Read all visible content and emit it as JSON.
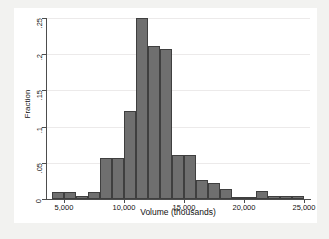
{
  "chart_data": {
    "type": "bar",
    "title": "",
    "xlabel": "Volume (thousands)",
    "ylabel": "Fraction",
    "xlim": [
      3500,
      25500
    ],
    "ylim": [
      0,
      0.25
    ],
    "grid": true,
    "legend": null,
    "bin_width": 1000,
    "bar_color": "#6f6f6f",
    "bar_edge_color": "#3f3f3f",
    "xticks": [
      5000,
      10000,
      15000,
      20000,
      25000
    ],
    "xtick_labels": [
      "5,000",
      "10,000",
      "15,000",
      "20,000",
      "25,000"
    ],
    "yticks": [
      0,
      0.05,
      0.1,
      0.15,
      0.2,
      0.25
    ],
    "ytick_labels": [
      "0",
      ".05",
      ".1",
      ".15",
      ".2",
      ".25"
    ],
    "bins": [
      {
        "x0": 4000,
        "x1": 5000,
        "value": 0.009
      },
      {
        "x0": 5000,
        "x1": 6000,
        "value": 0.009
      },
      {
        "x0": 6000,
        "x1": 7000,
        "value": 0.004
      },
      {
        "x0": 7000,
        "x1": 8000,
        "value": 0.01
      },
      {
        "x0": 8000,
        "x1": 9000,
        "value": 0.057
      },
      {
        "x0": 9000,
        "x1": 10000,
        "value": 0.057
      },
      {
        "x0": 10000,
        "x1": 11000,
        "value": 0.122
      },
      {
        "x0": 11000,
        "x1": 12000,
        "value": 0.25
      },
      {
        "x0": 12000,
        "x1": 13000,
        "value": 0.211
      },
      {
        "x0": 13000,
        "x1": 14000,
        "value": 0.207
      },
      {
        "x0": 14000,
        "x1": 15000,
        "value": 0.061
      },
      {
        "x0": 15000,
        "x1": 16000,
        "value": 0.061
      },
      {
        "x0": 16000,
        "x1": 17000,
        "value": 0.026
      },
      {
        "x0": 17000,
        "x1": 18000,
        "value": 0.022
      },
      {
        "x0": 18000,
        "x1": 19000,
        "value": 0.014
      },
      {
        "x0": 19000,
        "x1": 20000,
        "value": 0.003
      },
      {
        "x0": 20000,
        "x1": 21000,
        "value": 0.003
      },
      {
        "x0": 21000,
        "x1": 22000,
        "value": 0.011
      },
      {
        "x0": 22000,
        "x1": 23000,
        "value": 0.004
      },
      {
        "x0": 23000,
        "x1": 24000,
        "value": 0.004
      },
      {
        "x0": 24000,
        "x1": 25000,
        "value": 0.004
      }
    ]
  },
  "figure": {
    "background": "#f2f2f0",
    "panel_background": "#ffffff",
    "gridline_color": "#eceaea",
    "axis_color": "#4d4d4d"
  }
}
